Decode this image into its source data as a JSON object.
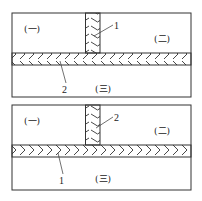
{
  "diagrams": [
    {
      "id": "top",
      "regions": {
        "left": "(一)",
        "right": "(二)",
        "bottom": "(三)"
      },
      "callouts": {
        "vertical_band": "1",
        "horizontal_band": "2"
      }
    },
    {
      "id": "bottom",
      "regions": {
        "left": "(一)",
        "right": "(二)",
        "bottom": "(三)"
      },
      "callouts": {
        "vertical_band": "2",
        "horizontal_band": "1"
      }
    }
  ],
  "colors": {
    "line": "#333333",
    "background": "#ffffff"
  }
}
